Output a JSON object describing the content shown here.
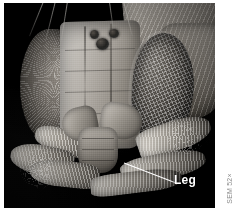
{
  "figure": {
    "kind": "sem-micrograph",
    "background_color": "#ffffff",
    "plate_color": "#050505",
    "annotations": [
      {
        "id": "leg",
        "label": "Leg",
        "color": "#ffffff",
        "leader": "diagonal line from label up-left to the leg structure"
      }
    ],
    "credit": {
      "text": "SEM 52×",
      "color": "#8d8d8d",
      "orientation": "vertical",
      "position": "right-margin-bottom"
    },
    "anatomy": [
      {
        "name": "compound-eye-right",
        "note": "ommatidia grid"
      },
      {
        "name": "compound-eye-left",
        "note": "bristly margin"
      },
      {
        "name": "frons-plate",
        "note": "flat face shield"
      },
      {
        "name": "ocelli",
        "note": "three simple eyes"
      },
      {
        "name": "maxillary-palps",
        "note": "mouthparts"
      },
      {
        "name": "labrum",
        "note": "lower mouthpart"
      },
      {
        "name": "legs",
        "note": "hairy tarsi"
      },
      {
        "name": "dorsum",
        "note": "bristled thorax"
      }
    ]
  }
}
